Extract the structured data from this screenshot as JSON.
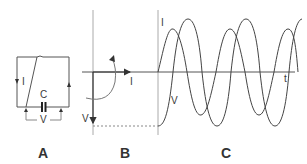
{
  "diagram": {
    "colors": {
      "line": "#555555",
      "light_line": "#888888",
      "text": "#3a3a3a",
      "background": "#ffffff"
    },
    "panels": [
      {
        "id": "A",
        "label": "A",
        "description": "capacitor circuit",
        "labels": {
          "current": "I",
          "capacitor": "C",
          "voltage": "V"
        }
      },
      {
        "id": "B",
        "label": "B",
        "description": "phasor diagram",
        "labels": {
          "current": "I",
          "voltage": "V"
        }
      },
      {
        "id": "C",
        "label": "C",
        "description": "current and voltage waveforms vs time",
        "labels": {
          "current": "I",
          "voltage": "V",
          "time_axis": "t"
        }
      }
    ]
  }
}
